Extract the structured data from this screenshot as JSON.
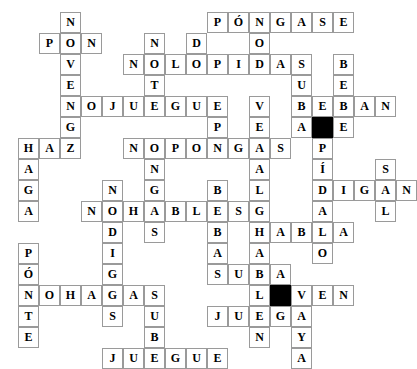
{
  "puzzle": {
    "title": "Spanish Imperative Crossword",
    "type": "crossword-grid",
    "columns": 16,
    "rows": 15,
    "cell_size": 21,
    "origin": {
      "x": 18,
      "y": 12
    },
    "colors": {
      "grid_line": "#9a9a9a",
      "block": "#000000",
      "letter": "#000000",
      "background": "#ffffff"
    },
    "entries": [
      {
        "word": "PONGASE",
        "display": "PÓNGASE",
        "row": 0,
        "col": 9,
        "dir": "across"
      },
      {
        "word": "PON",
        "display": "PON",
        "row": 1,
        "col": 0,
        "dir": "across"
      },
      {
        "word": "NOLOPIDAS",
        "display": "NOLOPIDAS",
        "row": 3,
        "col": 4,
        "dir": "across"
      },
      {
        "word": "NOJUEGUE",
        "display": "NOJUEGUE",
        "row": 5,
        "col": 1,
        "dir": "across"
      },
      {
        "word": "BEBAN",
        "display": "BEBAN",
        "row": 5,
        "col": 11,
        "dir": "across"
      },
      {
        "word": "HAZ",
        "display": "HAZ",
        "row": 7,
        "col": 0,
        "dir": "across"
      },
      {
        "word": "NOPONGAS",
        "display": "NOPONGAS",
        "row": 7,
        "col": 4,
        "dir": "across"
      },
      {
        "word": "DIGAN",
        "display": "DIGAN",
        "row": 10,
        "col": 11,
        "dir": "across"
      },
      {
        "word": "NOHABLES",
        "display": "NOHABLES",
        "row": 11,
        "col": 3,
        "dir": "across"
      },
      {
        "word": "HABLA",
        "display": "HABLA",
        "row": 12,
        "col": 10,
        "dir": "across"
      },
      {
        "word": "SUBA",
        "display": "SUBA",
        "row": 14,
        "col": 8,
        "dir": "across"
      },
      {
        "word": "NOHAGAS",
        "display": "NOHAGAS",
        "row": 16,
        "col": 0,
        "dir": "across"
      },
      {
        "word": "VEN",
        "display": "VEN",
        "row": 16,
        "col": 11,
        "dir": "across"
      },
      {
        "word": "JUEGA",
        "display": "JUEGA",
        "row": 17,
        "col": 8,
        "dir": "across"
      },
      {
        "word": "JUEGUE",
        "display": "JUEGUE",
        "row": 19,
        "col": 4,
        "dir": "across"
      }
    ],
    "letters": [
      {
        "r": 0,
        "c": 2,
        "ch": "N"
      },
      {
        "r": 0,
        "c": 9,
        "ch": "P"
      },
      {
        "r": 0,
        "c": 10,
        "ch": "Ó"
      },
      {
        "r": 0,
        "c": 11,
        "ch": "N"
      },
      {
        "r": 0,
        "c": 12,
        "ch": "G"
      },
      {
        "r": 0,
        "c": 13,
        "ch": "A"
      },
      {
        "r": 0,
        "c": 14,
        "ch": "S"
      },
      {
        "r": 0,
        "c": 15,
        "ch": "E"
      },
      {
        "r": 1,
        "c": 1,
        "ch": "P"
      },
      {
        "r": 1,
        "c": 2,
        "ch": "O"
      },
      {
        "r": 1,
        "c": 3,
        "ch": "N"
      },
      {
        "r": 1,
        "c": 6,
        "ch": "N"
      },
      {
        "r": 1,
        "c": 8,
        "ch": "D"
      },
      {
        "r": 1,
        "c": 11,
        "ch": "O"
      },
      {
        "r": 2,
        "c": 2,
        "ch": "V"
      },
      {
        "r": 2,
        "c": 5,
        "ch": "N"
      },
      {
        "r": 2,
        "c": 6,
        "ch": "O"
      },
      {
        "r": 2,
        "c": 7,
        "ch": "L"
      },
      {
        "r": 2,
        "c": 8,
        "ch": "O"
      },
      {
        "r": 2,
        "c": 9,
        "ch": "P"
      },
      {
        "r": 2,
        "c": 10,
        "ch": "I"
      },
      {
        "r": 2,
        "c": 11,
        "ch": "D"
      },
      {
        "r": 2,
        "c": 12,
        "ch": "A"
      },
      {
        "r": 2,
        "c": 13,
        "ch": "S"
      },
      {
        "r": 2,
        "c": 15,
        "ch": "B"
      },
      {
        "r": 3,
        "c": 2,
        "ch": "E"
      },
      {
        "r": 3,
        "c": 6,
        "ch": "T"
      },
      {
        "r": 3,
        "c": 13,
        "ch": "U"
      },
      {
        "r": 3,
        "c": 15,
        "ch": "E"
      },
      {
        "r": 4,
        "c": 2,
        "ch": "N"
      },
      {
        "r": 4,
        "c": 3,
        "ch": "O"
      },
      {
        "r": 4,
        "c": 4,
        "ch": "J"
      },
      {
        "r": 4,
        "c": 5,
        "ch": "U"
      },
      {
        "r": 4,
        "c": 6,
        "ch": "E"
      },
      {
        "r": 4,
        "c": 7,
        "ch": "G"
      },
      {
        "r": 4,
        "c": 8,
        "ch": "U"
      },
      {
        "r": 4,
        "c": 9,
        "ch": "E"
      },
      {
        "r": 4,
        "c": 11,
        "ch": "V"
      },
      {
        "r": 4,
        "c": 13,
        "ch": "B"
      },
      {
        "r": 4,
        "c": 14,
        "ch": "E"
      },
      {
        "r": 4,
        "c": 15,
        "ch": "B"
      },
      {
        "r": 4,
        "c": 16,
        "ch": "A"
      },
      {
        "r": 4,
        "c": 17,
        "ch": "N"
      },
      {
        "r": 5,
        "c": 2,
        "ch": "G"
      },
      {
        "r": 5,
        "c": 9,
        "ch": "P"
      },
      {
        "r": 5,
        "c": 11,
        "ch": "E"
      },
      {
        "r": 5,
        "c": 13,
        "ch": "A"
      },
      {
        "r": 5,
        "c": 14,
        "ch": "#"
      },
      {
        "r": 5,
        "c": 15,
        "ch": "E"
      },
      {
        "r": 6,
        "c": 0,
        "ch": "H"
      },
      {
        "r": 6,
        "c": 1,
        "ch": "A"
      },
      {
        "r": 6,
        "c": 2,
        "ch": "Z"
      },
      {
        "r": 6,
        "c": 5,
        "ch": "N"
      },
      {
        "r": 6,
        "c": 6,
        "ch": "O"
      },
      {
        "r": 6,
        "c": 7,
        "ch": "P"
      },
      {
        "r": 6,
        "c": 8,
        "ch": "O"
      },
      {
        "r": 6,
        "c": 9,
        "ch": "N"
      },
      {
        "r": 6,
        "c": 10,
        "ch": "G"
      },
      {
        "r": 6,
        "c": 11,
        "ch": "A"
      },
      {
        "r": 6,
        "c": 12,
        "ch": "S"
      },
      {
        "r": 6,
        "c": 14,
        "ch": "P"
      },
      {
        "r": 7,
        "c": 0,
        "ch": "A"
      },
      {
        "r": 7,
        "c": 6,
        "ch": "N"
      },
      {
        "r": 7,
        "c": 11,
        "ch": "A"
      },
      {
        "r": 7,
        "c": 14,
        "ch": "Í"
      },
      {
        "r": 7,
        "c": 17,
        "ch": "S"
      },
      {
        "r": 8,
        "c": 0,
        "ch": "G"
      },
      {
        "r": 8,
        "c": 4,
        "ch": "N"
      },
      {
        "r": 8,
        "c": 6,
        "ch": "G"
      },
      {
        "r": 8,
        "c": 9,
        "ch": "B"
      },
      {
        "r": 8,
        "c": 11,
        "ch": "L"
      },
      {
        "r": 8,
        "c": 14,
        "ch": "D"
      },
      {
        "r": 8,
        "c": 15,
        "ch": "I"
      },
      {
        "r": 8,
        "c": 16,
        "ch": "G"
      },
      {
        "r": 8,
        "c": 17,
        "ch": "A"
      },
      {
        "r": 8,
        "c": 18,
        "ch": "N"
      },
      {
        "r": 9,
        "c": 0,
        "ch": "A"
      },
      {
        "r": 9,
        "c": 3,
        "ch": "N"
      },
      {
        "r": 9,
        "c": 4,
        "ch": "O"
      },
      {
        "r": 9,
        "c": 5,
        "ch": "H"
      },
      {
        "r": 9,
        "c": 6,
        "ch": "A"
      },
      {
        "r": 9,
        "c": 7,
        "ch": "B"
      },
      {
        "r": 9,
        "c": 8,
        "ch": "L"
      },
      {
        "r": 9,
        "c": 9,
        "ch": "E"
      },
      {
        "r": 9,
        "c": 10,
        "ch": "S"
      },
      {
        "r": 9,
        "c": 11,
        "ch": "G"
      },
      {
        "r": 9,
        "c": 14,
        "ch": "A"
      },
      {
        "r": 9,
        "c": 17,
        "ch": "L"
      },
      {
        "r": 10,
        "c": 4,
        "ch": "D"
      },
      {
        "r": 10,
        "c": 6,
        "ch": "S"
      },
      {
        "r": 10,
        "c": 9,
        "ch": "B"
      },
      {
        "r": 10,
        "c": 11,
        "ch": "H"
      },
      {
        "r": 10,
        "c": 12,
        "ch": "A"
      },
      {
        "r": 10,
        "c": 13,
        "ch": "B"
      },
      {
        "r": 10,
        "c": 14,
        "ch": "L"
      },
      {
        "r": 10,
        "c": 15,
        "ch": "A"
      },
      {
        "r": 11,
        "c": 0,
        "ch": "P"
      },
      {
        "r": 11,
        "c": 4,
        "ch": "I"
      },
      {
        "r": 11,
        "c": 9,
        "ch": "A"
      },
      {
        "r": 11,
        "c": 11,
        "ch": "A"
      },
      {
        "r": 11,
        "c": 14,
        "ch": "O"
      },
      {
        "r": 12,
        "c": 0,
        "ch": "Ó"
      },
      {
        "r": 12,
        "c": 4,
        "ch": "G"
      },
      {
        "r": 12,
        "c": 9,
        "ch": "S"
      },
      {
        "r": 12,
        "c": 10,
        "ch": "U"
      },
      {
        "r": 12,
        "c": 11,
        "ch": "B"
      },
      {
        "r": 12,
        "c": 12,
        "ch": "A"
      },
      {
        "r": 13,
        "c": 0,
        "ch": "N"
      },
      {
        "r": 13,
        "c": 1,
        "ch": "O"
      },
      {
        "r": 13,
        "c": 2,
        "ch": "H"
      },
      {
        "r": 13,
        "c": 3,
        "ch": "A"
      },
      {
        "r": 13,
        "c": 4,
        "ch": "G"
      },
      {
        "r": 13,
        "c": 5,
        "ch": "A"
      },
      {
        "r": 13,
        "c": 6,
        "ch": "S"
      },
      {
        "r": 13,
        "c": 11,
        "ch": "L"
      },
      {
        "r": 13,
        "c": 12,
        "ch": "#"
      },
      {
        "r": 13,
        "c": 13,
        "ch": "V"
      },
      {
        "r": 13,
        "c": 14,
        "ch": "E"
      },
      {
        "r": 13,
        "c": 15,
        "ch": "N"
      },
      {
        "r": 14,
        "c": 0,
        "ch": "T"
      },
      {
        "r": 14,
        "c": 4,
        "ch": "S"
      },
      {
        "r": 14,
        "c": 6,
        "ch": "U"
      },
      {
        "r": 14,
        "c": 9,
        "ch": "J"
      },
      {
        "r": 14,
        "c": 10,
        "ch": "U"
      },
      {
        "r": 14,
        "c": 11,
        "ch": "E"
      },
      {
        "r": 14,
        "c": 12,
        "ch": "G"
      },
      {
        "r": 14,
        "c": 13,
        "ch": "A"
      },
      {
        "r": 15,
        "c": 0,
        "ch": "E"
      },
      {
        "r": 15,
        "c": 6,
        "ch": "B"
      },
      {
        "r": 15,
        "c": 11,
        "ch": "N"
      },
      {
        "r": 15,
        "c": 13,
        "ch": "Y"
      },
      {
        "r": 16,
        "c": 4,
        "ch": "J"
      },
      {
        "r": 16,
        "c": 5,
        "ch": "U"
      },
      {
        "r": 16,
        "c": 6,
        "ch": "E"
      },
      {
        "r": 16,
        "c": 7,
        "ch": "G"
      },
      {
        "r": 16,
        "c": 8,
        "ch": "U"
      },
      {
        "r": 16,
        "c": 9,
        "ch": "E"
      },
      {
        "r": 16,
        "c": 13,
        "ch": "A"
      }
    ]
  }
}
